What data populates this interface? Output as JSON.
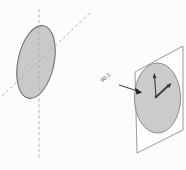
{
  "figure": {
    "annotation": {
      "label": "90.5"
    },
    "colors": {
      "background": "#fcfcfc",
      "disk_fill": "#c9c9c9",
      "disk_stroke": "#6e6e6e",
      "dashed_axis": "#ababab",
      "panel_stroke": "#9a9a9a",
      "clock_face_fill": "#cbcbcb",
      "clock_hand": "#3a3a3a",
      "arrow": "#222222"
    }
  }
}
